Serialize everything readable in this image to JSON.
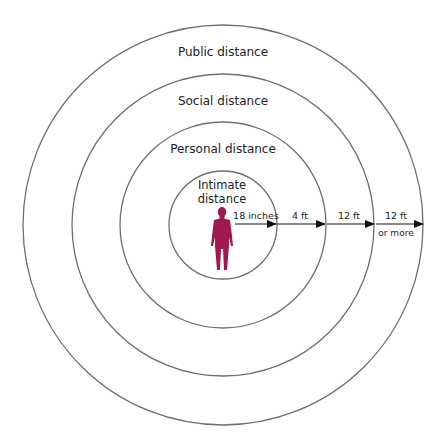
{
  "diagram": {
    "colors": {
      "circle_stroke": "#6e6e6e",
      "figure": "#a0184e",
      "arrow": "#111111",
      "text": "#222222"
    },
    "zones": [
      {
        "name": "intimate",
        "label_line1": "Intimate",
        "label_line2": "distance",
        "radius": 54
      },
      {
        "name": "personal",
        "label": "Personal distance",
        "radius": 103
      },
      {
        "name": "social",
        "label": "Social distance",
        "radius": 151
      },
      {
        "name": "public",
        "label": "Public distance",
        "radius": 200
      }
    ],
    "arrows": [
      {
        "label": "18 inches",
        "sublabel": ""
      },
      {
        "label": "4 ft",
        "sublabel": ""
      },
      {
        "label": "12 ft",
        "sublabel": ""
      },
      {
        "label": "12 ft",
        "sublabel": "or more"
      }
    ],
    "figure_icon": "human-figure-icon"
  }
}
